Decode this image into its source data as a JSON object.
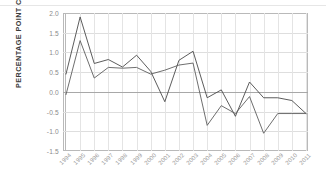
{
  "chart_data": {
    "type": "line",
    "title": "",
    "xlabel": "",
    "ylabel": "PERCENTAGE POINT CHANGE",
    "categories": [
      "1994",
      "1995",
      "1996",
      "1997",
      "1998",
      "1999",
      "2000",
      "2001",
      "2002",
      "2003",
      "2004",
      "2005",
      "2006",
      "2007",
      "2008",
      "2009",
      "2010",
      "2011"
    ],
    "ylim": [
      -1.5,
      2.0
    ],
    "yticks": [
      "2.0",
      "1.5",
      "1.0",
      "0.5",
      "0.0",
      "-0.5",
      "-1.0",
      "-1.5"
    ],
    "ytick_values": [
      2.0,
      1.5,
      1.0,
      0.5,
      0.0,
      -0.5,
      -1.0,
      -1.5
    ],
    "grid": true,
    "legend": "none",
    "zero_reference_line": 0.0,
    "series": [
      {
        "name": "series-1",
        "color": "#4a4a4a",
        "values": [
          0.45,
          1.9,
          0.72,
          0.82,
          0.63,
          0.93,
          0.52,
          -0.25,
          0.8,
          1.03,
          -0.15,
          0.05,
          -0.62,
          0.25,
          -0.15,
          -0.15,
          -0.22,
          -0.55
        ]
      },
      {
        "name": "series-2",
        "color": "#5d5d5d",
        "values": [
          -0.07,
          1.3,
          0.35,
          0.62,
          0.6,
          0.62,
          0.45,
          0.55,
          0.68,
          0.73,
          -0.85,
          -0.35,
          -0.55,
          -0.12,
          -1.05,
          -0.55,
          -0.55,
          -0.55
        ]
      }
    ]
  }
}
